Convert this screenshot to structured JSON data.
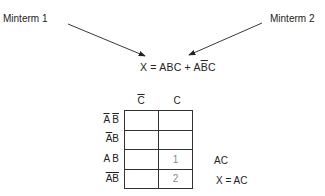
{
  "labels": {
    "minterm1": "Minterm 1",
    "minterm2": "Minterm 2"
  },
  "equation": {
    "lhs": "X",
    "equals": "=",
    "term1": "ABC",
    "plus": "+",
    "term2_a": "A",
    "term2_bbar": "B",
    "term2_c": "C"
  },
  "kmap": {
    "col_headers": [
      {
        "text": "C",
        "negated": true
      },
      {
        "text": "C",
        "negated": false
      }
    ],
    "row_headers": [
      {
        "display": "A B",
        "negation": "A and B each barred separately"
      },
      {
        "display": "A B",
        "negation": "A barred"
      },
      {
        "display": "A B",
        "negation": "none"
      },
      {
        "display": "AB",
        "negation": "B barred"
      }
    ],
    "cells": [
      [
        "",
        ""
      ],
      [
        "",
        ""
      ],
      [
        "",
        "1"
      ],
      [
        "",
        "2"
      ]
    ]
  },
  "annotations": {
    "group": "AC",
    "result": "X = AC"
  }
}
